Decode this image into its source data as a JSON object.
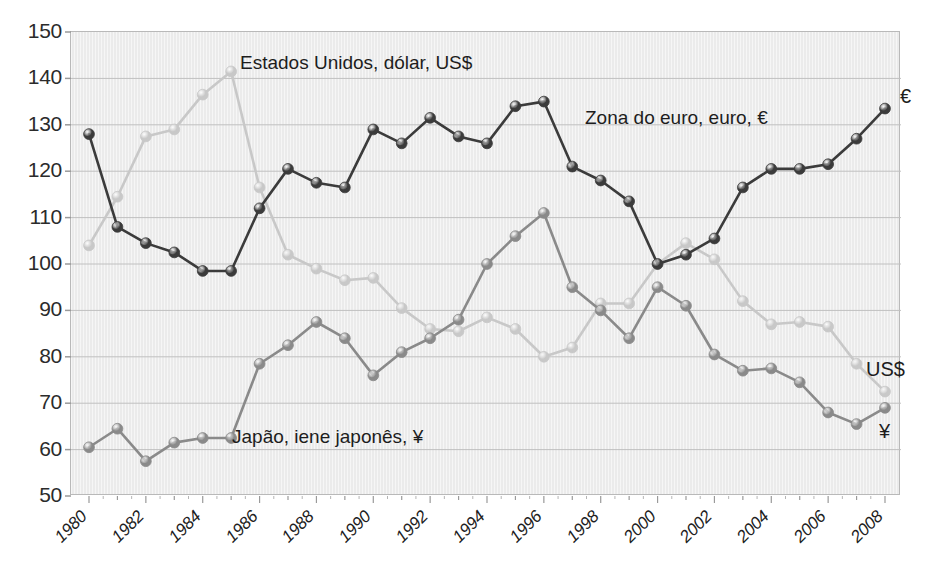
{
  "chart_data": {
    "type": "line",
    "title": "",
    "subtitle": "",
    "xlabel": "",
    "ylabel": "",
    "xlim": [
      1980,
      2008
    ],
    "ylim": [
      50,
      150
    ],
    "yticks": [
      50,
      60,
      70,
      80,
      90,
      100,
      110,
      120,
      130,
      140,
      150
    ],
    "xticks": [
      1980,
      1982,
      1984,
      1986,
      1988,
      1990,
      1992,
      1994,
      1996,
      1998,
      2000,
      2002,
      2004,
      2006,
      2008
    ],
    "x": [
      1980,
      1981,
      1982,
      1983,
      1984,
      1985,
      1986,
      1987,
      1988,
      1989,
      1990,
      1991,
      1992,
      1993,
      1994,
      1995,
      1996,
      1997,
      1998,
      1999,
      2000,
      2001,
      2002,
      2003,
      2004,
      2005,
      2006,
      2007,
      2008
    ],
    "grid": true,
    "legend_position": "inline-annotations",
    "series": [
      {
        "name": "Zona do euro, euro, €",
        "end_label": "€",
        "color": "#3b3b3b",
        "values": [
          128,
          108,
          104.5,
          102.5,
          98.5,
          98.5,
          112,
          120.5,
          117.5,
          116.5,
          129,
          126,
          131.5,
          127.5,
          126,
          134,
          135,
          121,
          118,
          113.5,
          100,
          102,
          105.5,
          116.5,
          120.5,
          120.5,
          121.5,
          127,
          133.5
        ]
      },
      {
        "name": "Estados Unidos, dólar, US$",
        "end_label": "US$",
        "color": "#c8c8c8",
        "values": [
          104,
          114.5,
          127.5,
          129,
          136.5,
          141.5,
          116.5,
          102,
          99,
          96.5,
          97,
          90.5,
          86,
          85.5,
          88.5,
          86,
          80,
          82,
          91.5,
          91.5,
          100,
          104.5,
          101,
          92,
          87,
          87.5,
          86.5,
          78.5,
          72.5
        ]
      },
      {
        "name": "Japão, iene japonês, ¥",
        "end_label": "¥",
        "color": "#8a8a8a",
        "values": [
          60.5,
          64.5,
          57.5,
          61.5,
          62.5,
          62.5,
          78.5,
          82.5,
          87.5,
          84,
          76,
          81,
          84,
          88,
          100,
          106,
          111,
          95,
          90,
          84,
          95,
          91,
          80.5,
          77,
          77.5,
          74.5,
          68,
          65.5,
          69
        ]
      }
    ],
    "annotations": [
      {
        "text": "Estados Unidos, dólar, US$",
        "x_px": 240,
        "y_px": 52
      },
      {
        "text": "Zona do euro, euro, €",
        "x_px": 585,
        "y_px": 107
      },
      {
        "text": "Japão, iene japonês, ¥",
        "x_px": 232,
        "y_px": 426
      }
    ],
    "end_labels": [
      {
        "text": "€",
        "x_px": 900,
        "y_px": 85
      },
      {
        "text": "US$",
        "x_px": 866,
        "y_px": 358
      },
      {
        "text": "¥",
        "x_px": 879,
        "y_px": 420
      }
    ]
  }
}
